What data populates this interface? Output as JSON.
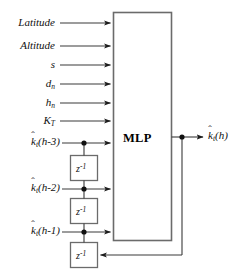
{
  "diagram": {
    "background_color": "#ffffff",
    "line_color": "#3a3a3a",
    "box_border_color": "#555555",
    "text_color": "#111111",
    "processor": {
      "label": "MLP",
      "name": "mlp-block"
    },
    "inputs": [
      {
        "label": "Latitude",
        "kind": "plain"
      },
      {
        "label": "Altitude",
        "kind": "plain"
      },
      {
        "label": "s",
        "kind": "plain"
      },
      {
        "label": "d",
        "subscript": "n",
        "kind": "subscripted"
      },
      {
        "label": "h",
        "subscript": "n",
        "kind": "subscripted"
      },
      {
        "label": "K",
        "subscript": "T",
        "kind": "subscripted"
      }
    ],
    "delayed_inputs": [
      {
        "base": "k",
        "hat": "ˆ",
        "subscript": "t",
        "arg": "(h-3)"
      },
      {
        "base": "k",
        "hat": "ˆ",
        "subscript": "t",
        "arg": "(h-2)"
      },
      {
        "base": "k",
        "hat": "ˆ",
        "subscript": "t",
        "arg": "(h-1)"
      }
    ],
    "delay_blocks": [
      {
        "symbol": "z",
        "exponent": "-1"
      },
      {
        "symbol": "z",
        "exponent": "-1"
      },
      {
        "symbol": "z",
        "exponent": "-1"
      }
    ],
    "output": {
      "base": "k",
      "hat": "ˆ",
      "subscript": "t",
      "arg": "(h)"
    }
  }
}
